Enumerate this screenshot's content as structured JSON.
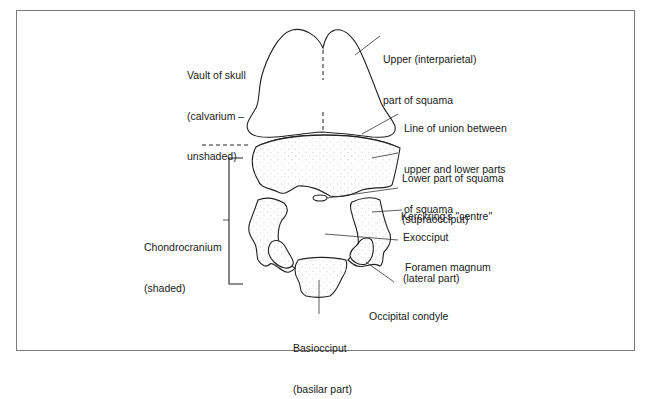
{
  "figure": {
    "colors": {
      "line": "#222222",
      "frame": "#7a7a7a",
      "shading_dot": "#9a9a9a",
      "background": "#ffffff"
    }
  },
  "labels": {
    "vault": {
      "lines": [
        "Vault of skull",
        "(calvarium –",
        "unshaded)"
      ]
    },
    "upper_squama": {
      "lines": [
        "Upper (interparietal)",
        "part of squama"
      ]
    },
    "line_of_union": {
      "lines": [
        "Line of union between",
        "upper and lower parts",
        "of squama"
      ]
    },
    "lower_squama": {
      "lines": [
        "Lower part of squama",
        "(supraocciput)"
      ]
    },
    "kerckring": {
      "lines": [
        "Kerckring's \"centre\""
      ]
    },
    "exocciput": {
      "lines": [
        "Exocciput",
        "(lateral part)"
      ]
    },
    "foramen_magnum": {
      "lines": [
        "Foramen magnum"
      ]
    },
    "chondrocranium": {
      "lines": [
        "Chondrocranium",
        "(shaded)"
      ]
    },
    "occipital_condyle": {
      "lines": [
        "Occipital condyle"
      ]
    },
    "basiocciput": {
      "lines": [
        "Basiocciput",
        "(basilar part)"
      ]
    }
  }
}
